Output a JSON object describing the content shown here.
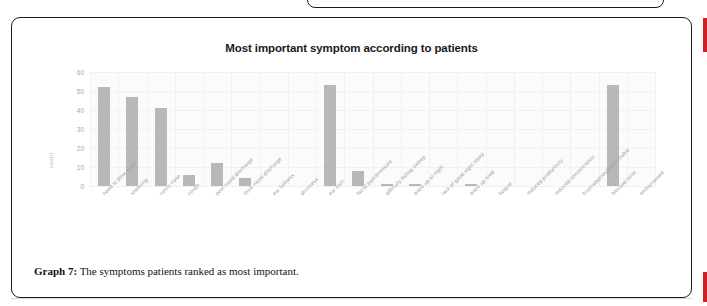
{
  "page": {
    "accent_color": "#cf2027",
    "card_border_color": "#1c1c1c",
    "background": "#ffffff"
  },
  "figure": {
    "caption_label": "Graph 7:",
    "caption_text": " The symptoms patients ranked as most important."
  },
  "chart_data": {
    "type": "bar",
    "title": "Most important symptom according to patients",
    "xlabel": "",
    "ylabel": "count",
    "ylim": [
      0,
      60
    ],
    "yticks": [
      0,
      10,
      20,
      30,
      40,
      50,
      60
    ],
    "grid": true,
    "legend": "none",
    "bar_color": "#b8b8b8",
    "plot_background": "#fbfbfc",
    "categories": [
      "need to blow nose",
      "sneezing",
      "runny nose",
      "cough",
      "post nasal discharge",
      "thick nasal discharge",
      "ear fullness",
      "dizziness",
      "ear pain",
      "facial pain/pressure",
      "difficulty falling asleep",
      "wake up at night",
      "lack of good night sleep",
      "wake up tired",
      "fatigue",
      "reduced productivity",
      "reduced concentration",
      "frustrated/restless/irritable",
      "blocked nose",
      "embarrassed"
    ],
    "values": [
      52,
      47,
      41,
      6,
      12,
      4,
      0,
      0,
      53,
      8,
      1,
      1,
      0,
      1,
      0,
      0,
      0,
      0,
      53,
      0
    ]
  }
}
